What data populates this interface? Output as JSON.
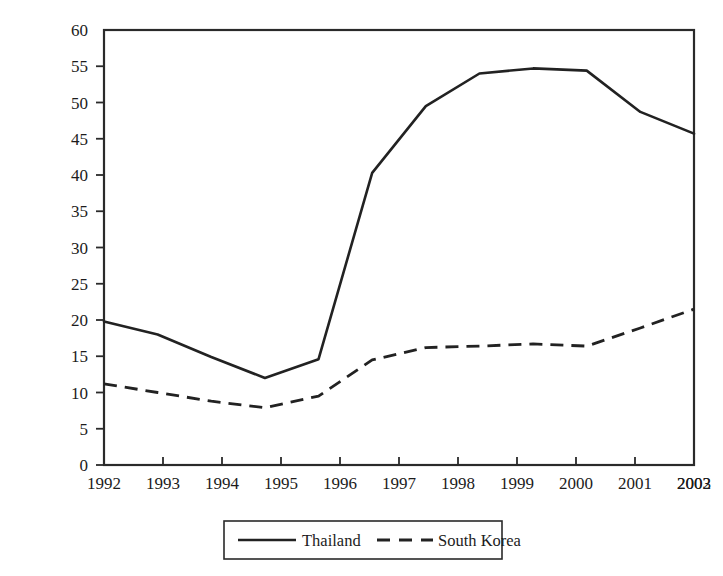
{
  "chart_data": {
    "type": "line",
    "title": "",
    "subtitle": "",
    "xlabel": "",
    "ylabel": "",
    "categories": [
      "1992",
      "1993",
      "1994",
      "1995",
      "1996",
      "1997",
      "1998",
      "1999",
      "2000",
      "2001",
      "2002",
      "2003"
    ],
    "x": [
      1992,
      1993,
      1994,
      1995,
      1996,
      1997,
      1998,
      1999,
      2000,
      2001,
      2002,
      2003
    ],
    "series": [
      {
        "name": "Thailand",
        "style": "solid",
        "color": "#222222",
        "values": [
          19.8,
          18.0,
          14.9,
          12.0,
          14.6,
          40.3,
          49.5,
          54.0,
          54.7,
          54.4,
          48.7,
          45.7
        ]
      },
      {
        "name": "South Korea",
        "style": "dashed",
        "color": "#222222",
        "values": [
          11.2,
          10.0,
          8.8,
          7.9,
          9.5,
          14.5,
          16.2,
          16.4,
          16.7,
          16.4,
          18.9,
          21.5
        ]
      }
    ],
    "ylim": [
      0,
      60
    ],
    "yticks": [
      0,
      5,
      10,
      15,
      20,
      25,
      30,
      35,
      40,
      45,
      50,
      55,
      60
    ],
    "ytick_labels": [
      "0",
      "5",
      "10",
      "15",
      "20",
      "25",
      "30",
      "35",
      "40",
      "45",
      "50",
      "55",
      "60"
    ],
    "xtick_labels": [
      "1992",
      "1993",
      "1994",
      "1995",
      "1996",
      "1997",
      "1998",
      "1999",
      "2000",
      "2001",
      "2002",
      "2003"
    ],
    "grid": false,
    "legend": {
      "position": "bottom-center",
      "entries": [
        {
          "label": "Thailand",
          "style": "solid"
        },
        {
          "label": "South Korea",
          "style": "dashed"
        }
      ]
    },
    "axis_color": "#2a2a2a"
  }
}
